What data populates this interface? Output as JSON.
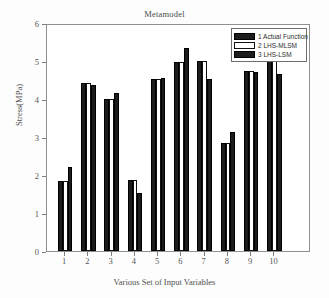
{
  "chart_data": {
    "type": "bar",
    "title": "Metamodel",
    "xlabel": "Various Set of Input Variables",
    "ylabel": "Stress(MPa)",
    "categories": [
      "1",
      "2",
      "3",
      "4",
      "5",
      "6",
      "7",
      "8",
      "9",
      "10"
    ],
    "ylim": [
      0,
      6
    ],
    "yticks": [
      0,
      1,
      2,
      3,
      4,
      5,
      6
    ],
    "ytick_labels": [
      "0",
      "1",
      "2",
      "3",
      "4",
      "5",
      "6"
    ],
    "xtick_labels": [
      "1",
      "2",
      "3",
      "4",
      "5",
      "6",
      "7",
      "8",
      "9",
      "10"
    ],
    "grid": false,
    "legend_position": "top-right",
    "series": [
      {
        "name": "1 Actual Function",
        "color": "#1c1c1c",
        "values": [
          1.85,
          4.42,
          4.0,
          1.88,
          4.52,
          4.97,
          5.0,
          2.83,
          4.75,
          5.0
        ]
      },
      {
        "name": "2 LHS-MLSM",
        "color": "#ffffff",
        "values": [
          1.85,
          4.42,
          4.0,
          1.88,
          4.52,
          4.97,
          5.0,
          2.83,
          4.75,
          5.0
        ]
      },
      {
        "name": "3 LHS-LSM",
        "color": "#1c1c1c",
        "values": [
          2.2,
          4.38,
          4.17,
          1.53,
          4.55,
          5.35,
          4.52,
          3.12,
          4.7,
          4.65
        ]
      }
    ]
  }
}
